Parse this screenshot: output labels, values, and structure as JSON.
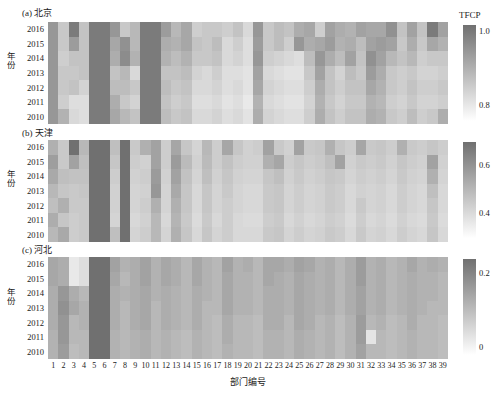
{
  "figure": {
    "xaxis_label": "部门编号",
    "yaxis_label": "年份",
    "colorbar_title": "TFCP",
    "years": [
      "2016",
      "2015",
      "2014",
      "2013",
      "2012",
      "2011",
      "2010"
    ],
    "departments": [
      "1",
      "2",
      "3",
      "4",
      "5",
      "6",
      "7",
      "8",
      "9",
      "10",
      "11",
      "12",
      "13",
      "14",
      "15",
      "16",
      "17",
      "18",
      "19",
      "20",
      "21",
      "22",
      "23",
      "24",
      "25",
      "26",
      "27",
      "28",
      "29",
      "30",
      "31",
      "32",
      "33",
      "34",
      "35",
      "36",
      "37",
      "38",
      "39"
    ],
    "colormap": {
      "low_hex": "#ffffff",
      "high_hex": "#707070",
      "name": "greys-reversed"
    }
  },
  "chart_data": {
    "type": "heatmap",
    "title": "",
    "xlabel": "部门编号",
    "ylabel": "年份",
    "x": [
      "1",
      "2",
      "3",
      "4",
      "5",
      "6",
      "7",
      "8",
      "9",
      "10",
      "11",
      "12",
      "13",
      "14",
      "15",
      "16",
      "17",
      "18",
      "19",
      "20",
      "21",
      "22",
      "23",
      "24",
      "25",
      "26",
      "27",
      "28",
      "29",
      "30",
      "31",
      "32",
      "33",
      "34",
      "35",
      "36",
      "37",
      "38",
      "39"
    ],
    "y": [
      "2016",
      "2015",
      "2014",
      "2013",
      "2012",
      "2011",
      "2010"
    ],
    "grid": false,
    "legend_position": "right",
    "panels": [
      {
        "id": "a",
        "label": "(a) 北京",
        "region": "北京",
        "colorbar": {
          "title": "TFCP",
          "vmin": 0.76,
          "vmax": 1.02,
          "ticks": [
            {
              "value": 1.0,
              "label": "1.0"
            },
            {
              "value": 0.8,
              "label": "0.8"
            }
          ]
        },
        "values": [
          [
            0.95,
            0.86,
            1.0,
            0.87,
            1.0,
            1.0,
            0.95,
            0.86,
            0.89,
            1.0,
            1.0,
            0.94,
            0.89,
            0.92,
            0.85,
            0.86,
            0.86,
            0.85,
            0.87,
            0.83,
            0.95,
            0.86,
            0.88,
            0.87,
            0.91,
            0.92,
            0.85,
            0.93,
            0.91,
            0.9,
            0.93,
            0.92,
            0.92,
            0.96,
            0.87,
            0.93,
            0.87,
            1.0,
            0.93
          ],
          [
            0.95,
            0.86,
            0.94,
            0.87,
            1.0,
            1.0,
            0.92,
            0.96,
            0.89,
            1.0,
            1.0,
            0.91,
            0.9,
            0.92,
            0.87,
            0.86,
            0.88,
            0.83,
            0.85,
            0.82,
            0.94,
            0.86,
            0.88,
            0.85,
            0.95,
            0.91,
            0.92,
            0.94,
            0.9,
            0.91,
            0.88,
            0.93,
            0.94,
            0.93,
            0.86,
            0.91,
            0.86,
            0.92,
            0.9
          ],
          [
            0.95,
            0.85,
            0.87,
            0.87,
            1.0,
            1.0,
            0.91,
            0.97,
            0.9,
            1.0,
            1.0,
            0.9,
            0.88,
            0.9,
            0.86,
            0.86,
            0.87,
            0.83,
            0.84,
            0.82,
            0.95,
            0.85,
            0.84,
            0.83,
            0.82,
            0.88,
            0.95,
            0.91,
            0.88,
            0.93,
            0.87,
            0.96,
            0.93,
            0.89,
            0.87,
            0.89,
            0.85,
            0.86,
            0.86
          ],
          [
            0.95,
            0.86,
            0.86,
            0.87,
            1.0,
            1.0,
            0.87,
            0.89,
            0.83,
            1.0,
            1.0,
            0.87,
            0.87,
            0.88,
            0.84,
            0.83,
            0.85,
            0.82,
            0.82,
            0.81,
            0.93,
            0.83,
            0.82,
            0.81,
            0.81,
            0.86,
            0.93,
            0.87,
            0.84,
            0.88,
            0.86,
            0.94,
            0.91,
            0.86,
            0.85,
            0.86,
            0.84,
            0.84,
            0.85
          ],
          [
            0.95,
            0.86,
            0.87,
            0.84,
            1.0,
            1.0,
            0.88,
            0.88,
            0.86,
            1.0,
            1.0,
            0.88,
            0.86,
            0.87,
            0.83,
            0.83,
            0.84,
            0.82,
            0.83,
            0.81,
            0.92,
            0.84,
            0.83,
            0.82,
            0.82,
            0.85,
            0.91,
            0.87,
            0.85,
            0.87,
            0.87,
            0.92,
            0.9,
            0.86,
            0.85,
            0.87,
            0.85,
            0.85,
            0.86
          ],
          [
            0.95,
            0.85,
            0.82,
            0.82,
            1.0,
            1.0,
            0.91,
            0.86,
            0.84,
            1.0,
            1.0,
            0.87,
            0.85,
            0.86,
            0.82,
            0.82,
            0.83,
            0.81,
            0.82,
            0.8,
            0.9,
            0.83,
            0.82,
            0.81,
            0.81,
            0.84,
            0.9,
            0.86,
            0.84,
            0.86,
            0.86,
            0.9,
            0.89,
            0.85,
            0.84,
            0.86,
            0.84,
            0.84,
            0.85
          ],
          [
            0.95,
            0.9,
            0.83,
            0.82,
            1.0,
            1.0,
            0.92,
            0.89,
            0.87,
            1.0,
            1.0,
            0.88,
            0.86,
            0.87,
            0.83,
            0.83,
            0.84,
            0.82,
            0.83,
            0.81,
            0.91,
            0.84,
            0.83,
            0.82,
            0.82,
            0.85,
            0.91,
            0.87,
            0.85,
            0.87,
            0.87,
            0.91,
            0.9,
            0.86,
            0.85,
            0.88,
            0.85,
            0.86,
            0.91
          ]
        ]
      },
      {
        "id": "b",
        "label": "(b) 天津",
        "region": "天津",
        "colorbar": {
          "title": "",
          "vmin": 0.3,
          "vmax": 0.7,
          "ticks": [
            {
              "value": 0.6,
              "label": "0.6"
            },
            {
              "value": 0.4,
              "label": "0.4"
            }
          ]
        },
        "values": [
          [
            0.52,
            0.45,
            0.7,
            0.5,
            0.7,
            0.7,
            0.48,
            0.7,
            0.45,
            0.52,
            0.56,
            0.44,
            0.55,
            0.46,
            0.42,
            0.5,
            0.44,
            0.55,
            0.46,
            0.43,
            0.44,
            0.56,
            0.45,
            0.43,
            0.56,
            0.45,
            0.46,
            0.52,
            0.46,
            0.44,
            0.55,
            0.45,
            0.46,
            0.44,
            0.52,
            0.45,
            0.44,
            0.46,
            0.44
          ],
          [
            0.57,
            0.45,
            0.56,
            0.48,
            0.7,
            0.7,
            0.46,
            0.7,
            0.44,
            0.43,
            0.56,
            0.44,
            0.58,
            0.49,
            0.43,
            0.49,
            0.44,
            0.47,
            0.44,
            0.43,
            0.43,
            0.52,
            0.55,
            0.44,
            0.46,
            0.44,
            0.45,
            0.48,
            0.56,
            0.43,
            0.45,
            0.44,
            0.45,
            0.43,
            0.46,
            0.44,
            0.43,
            0.56,
            0.43
          ],
          [
            0.54,
            0.48,
            0.47,
            0.47,
            0.7,
            0.7,
            0.44,
            0.7,
            0.43,
            0.44,
            0.58,
            0.43,
            0.56,
            0.47,
            0.42,
            0.48,
            0.43,
            0.46,
            0.43,
            0.42,
            0.42,
            0.46,
            0.48,
            0.43,
            0.45,
            0.43,
            0.44,
            0.46,
            0.45,
            0.42,
            0.44,
            0.43,
            0.44,
            0.42,
            0.45,
            0.43,
            0.42,
            0.52,
            0.42
          ],
          [
            0.5,
            0.46,
            0.45,
            0.46,
            0.7,
            0.7,
            0.43,
            0.7,
            0.42,
            0.43,
            0.59,
            0.42,
            0.54,
            0.46,
            0.41,
            0.46,
            0.42,
            0.45,
            0.42,
            0.41,
            0.41,
            0.45,
            0.46,
            0.42,
            0.44,
            0.42,
            0.43,
            0.45,
            0.44,
            0.41,
            0.43,
            0.42,
            0.43,
            0.41,
            0.44,
            0.42,
            0.41,
            0.48,
            0.41
          ],
          [
            0.48,
            0.52,
            0.45,
            0.45,
            0.7,
            0.7,
            0.43,
            0.7,
            0.42,
            0.44,
            0.52,
            0.42,
            0.52,
            0.46,
            0.41,
            0.46,
            0.42,
            0.44,
            0.42,
            0.41,
            0.41,
            0.45,
            0.46,
            0.42,
            0.44,
            0.42,
            0.43,
            0.45,
            0.44,
            0.41,
            0.45,
            0.42,
            0.43,
            0.41,
            0.44,
            0.42,
            0.41,
            0.46,
            0.41
          ],
          [
            0.53,
            0.46,
            0.44,
            0.45,
            0.7,
            0.7,
            0.42,
            0.7,
            0.41,
            0.43,
            0.5,
            0.41,
            0.51,
            0.45,
            0.4,
            0.45,
            0.41,
            0.44,
            0.41,
            0.4,
            0.4,
            0.44,
            0.45,
            0.41,
            0.43,
            0.41,
            0.42,
            0.44,
            0.43,
            0.4,
            0.44,
            0.41,
            0.42,
            0.4,
            0.43,
            0.41,
            0.4,
            0.45,
            0.4
          ],
          [
            0.5,
            0.54,
            0.44,
            0.45,
            0.7,
            0.7,
            0.48,
            0.7,
            0.42,
            0.44,
            0.5,
            0.42,
            0.52,
            0.46,
            0.41,
            0.46,
            0.42,
            0.44,
            0.41,
            0.41,
            0.41,
            0.45,
            0.46,
            0.42,
            0.44,
            0.42,
            0.43,
            0.45,
            0.44,
            0.41,
            0.45,
            0.42,
            0.43,
            0.41,
            0.44,
            0.42,
            0.41,
            0.46,
            0.41
          ]
        ]
      },
      {
        "id": "c",
        "label": "(c) 河北",
        "region": "河北",
        "colorbar": {
          "title": "",
          "vmin": -0.02,
          "vmax": 0.24,
          "ticks": [
            {
              "value": 0.2,
              "label": "0.2"
            },
            {
              "value": 0.0,
              "label": "0"
            }
          ]
        },
        "values": [
          [
            0.14,
            0.13,
            0.02,
            0.04,
            0.24,
            0.24,
            0.15,
            0.12,
            0.13,
            0.15,
            0.12,
            0.14,
            0.13,
            0.11,
            0.14,
            0.12,
            0.11,
            0.15,
            0.12,
            0.13,
            0.11,
            0.14,
            0.14,
            0.13,
            0.15,
            0.14,
            0.12,
            0.13,
            0.11,
            0.13,
            0.16,
            0.12,
            0.13,
            0.11,
            0.12,
            0.14,
            0.12,
            0.13,
            0.12
          ],
          [
            0.14,
            0.13,
            0.02,
            0.04,
            0.24,
            0.24,
            0.14,
            0.11,
            0.13,
            0.15,
            0.12,
            0.14,
            0.13,
            0.11,
            0.14,
            0.12,
            0.11,
            0.14,
            0.12,
            0.12,
            0.11,
            0.14,
            0.13,
            0.12,
            0.14,
            0.13,
            0.12,
            0.13,
            0.11,
            0.13,
            0.16,
            0.12,
            0.13,
            0.11,
            0.12,
            0.13,
            0.12,
            0.12,
            0.11
          ],
          [
            0.13,
            0.17,
            0.13,
            0.11,
            0.24,
            0.24,
            0.13,
            0.12,
            0.13,
            0.14,
            0.12,
            0.13,
            0.12,
            0.11,
            0.13,
            0.12,
            0.11,
            0.14,
            0.12,
            0.12,
            0.11,
            0.13,
            0.13,
            0.12,
            0.14,
            0.13,
            0.12,
            0.13,
            0.11,
            0.13,
            0.15,
            0.12,
            0.13,
            0.11,
            0.12,
            0.13,
            0.12,
            0.12,
            0.11
          ],
          [
            0.13,
            0.18,
            0.14,
            0.12,
            0.24,
            0.24,
            0.13,
            0.11,
            0.13,
            0.14,
            0.11,
            0.13,
            0.12,
            0.11,
            0.13,
            0.11,
            0.11,
            0.14,
            0.12,
            0.12,
            0.11,
            0.13,
            0.13,
            0.12,
            0.14,
            0.13,
            0.12,
            0.13,
            0.11,
            0.13,
            0.15,
            0.12,
            0.13,
            0.11,
            0.12,
            0.13,
            0.12,
            0.11,
            0.11
          ],
          [
            0.13,
            0.17,
            0.11,
            0.12,
            0.24,
            0.24,
            0.13,
            0.11,
            0.13,
            0.14,
            0.11,
            0.13,
            0.12,
            0.11,
            0.13,
            0.11,
            0.1,
            0.13,
            0.11,
            0.11,
            0.1,
            0.13,
            0.13,
            0.11,
            0.14,
            0.13,
            0.11,
            0.12,
            0.1,
            0.12,
            0.16,
            0.11,
            0.12,
            0.1,
            0.11,
            0.13,
            0.11,
            0.11,
            0.1
          ],
          [
            0.12,
            0.17,
            0.11,
            0.11,
            0.24,
            0.24,
            0.12,
            0.11,
            0.12,
            0.13,
            0.11,
            0.12,
            0.11,
            0.1,
            0.12,
            0.11,
            0.1,
            0.13,
            0.11,
            0.11,
            0.1,
            0.12,
            0.12,
            0.11,
            0.13,
            0.12,
            0.11,
            0.12,
            0.1,
            0.12,
            0.16,
            0.03,
            0.11,
            0.1,
            0.11,
            0.12,
            0.11,
            0.11,
            0.1
          ],
          [
            0.12,
            0.16,
            0.1,
            0.11,
            0.24,
            0.24,
            0.12,
            0.11,
            0.12,
            0.13,
            0.11,
            0.12,
            0.11,
            0.1,
            0.12,
            0.11,
            0.1,
            0.12,
            0.11,
            0.11,
            0.1,
            0.12,
            0.12,
            0.11,
            0.13,
            0.12,
            0.11,
            0.12,
            0.1,
            0.12,
            0.15,
            0.11,
            0.11,
            0.1,
            0.11,
            0.12,
            0.11,
            0.11,
            0.1
          ]
        ]
      }
    ]
  }
}
